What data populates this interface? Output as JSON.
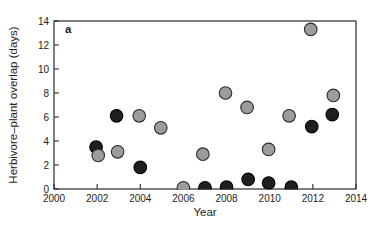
{
  "figure": {
    "panel_label": "a",
    "xlabel": "Year",
    "ylabel": "Herbivore–plant overlap (days)"
  },
  "chart_data": {
    "type": "scatter",
    "panel_label": "a",
    "xlabel": "Year",
    "ylabel": "Herbivore–plant overlap (days)",
    "xlim": [
      2000,
      2014
    ],
    "ylim": [
      0,
      14
    ],
    "xticks": [
      2000,
      2002,
      2004,
      2006,
      2008,
      2010,
      2012,
      2014
    ],
    "yticks": [
      0,
      2,
      4,
      6,
      8,
      10,
      12,
      14
    ],
    "grid": false,
    "legend": "none",
    "box": true,
    "axis_color": "#2a2a2a",
    "marker_radius_px": 6.3,
    "series": [
      {
        "name": "dark-circles",
        "marker": "circle",
        "fill": "#1f1f1f",
        "stroke": "#000000",
        "points": [
          {
            "x": 2001.95,
            "y": 3.5
          },
          {
            "x": 2002.9,
            "y": 6.1
          },
          {
            "x": 2004.0,
            "y": 1.8
          },
          {
            "x": 2007.0,
            "y": 0.1
          },
          {
            "x": 2008.0,
            "y": 0.15
          },
          {
            "x": 2009.0,
            "y": 0.8
          },
          {
            "x": 2009.95,
            "y": 0.5
          },
          {
            "x": 2011.0,
            "y": 0.15
          },
          {
            "x": 2011.95,
            "y": 5.2
          },
          {
            "x": 2012.9,
            "y": 6.2
          }
        ]
      },
      {
        "name": "gray-circles",
        "marker": "circle",
        "fill": "#9c9c9c",
        "stroke": "#2b2b2b",
        "points": [
          {
            "x": 2002.05,
            "y": 2.8
          },
          {
            "x": 2002.95,
            "y": 3.1
          },
          {
            "x": 2003.95,
            "y": 6.1
          },
          {
            "x": 2004.95,
            "y": 5.1
          },
          {
            "x": 2006.0,
            "y": 0.1
          },
          {
            "x": 2006.9,
            "y": 2.9
          },
          {
            "x": 2007.95,
            "y": 8.0
          },
          {
            "x": 2008.95,
            "y": 6.8
          },
          {
            "x": 2009.95,
            "y": 3.3
          },
          {
            "x": 2010.9,
            "y": 6.1
          },
          {
            "x": 2011.9,
            "y": 13.3
          },
          {
            "x": 2012.95,
            "y": 7.8
          }
        ]
      }
    ]
  }
}
